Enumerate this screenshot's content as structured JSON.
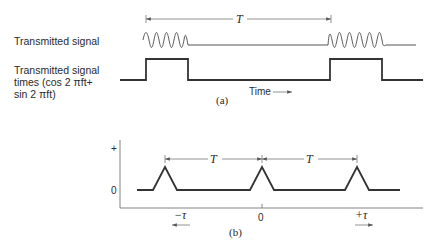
{
  "panel_a": {
    "row1_label": "Transmitted signal",
    "row2_label_lines": [
      "Transmitted signal",
      "times (cos 2 πft+",
      "sin 2 πft)"
    ],
    "period_label": "T",
    "time_label": "Time",
    "caption": "(a)"
  },
  "panel_b": {
    "y_plus_label": "+",
    "y_zero_label": "0",
    "x_zero_label": "0",
    "period_label_left": "T",
    "period_label_right": "T",
    "neg_tau_label": "−τ",
    "pos_tau_label": "+τ",
    "caption": "(b)"
  },
  "colors": {
    "signal": "#333333",
    "guide": "#777777",
    "text": "#2a2a2a"
  }
}
